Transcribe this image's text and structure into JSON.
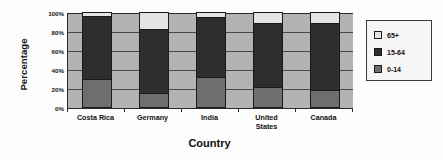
{
  "chart_data": {
    "type": "bar",
    "subtype": "stacked-percentage-column",
    "title": "",
    "xlabel": "Country",
    "ylabel": "Percentage",
    "categories": [
      "Costa Rica",
      "Germany",
      "India",
      "United States",
      "Canada"
    ],
    "category_lines": [
      [
        "Costa Rica"
      ],
      [
        "Germany"
      ],
      [
        "India"
      ],
      [
        "United",
        "States"
      ],
      [
        "Canada"
      ]
    ],
    "series": [
      {
        "name": "0-14",
        "color": "#6e6e6e",
        "values": [
          30,
          15,
          32,
          21,
          18
        ]
      },
      {
        "name": "15-64",
        "color": "#2e2e2e",
        "values": [
          66,
          67,
          63,
          67,
          70
        ]
      },
      {
        "name": "65+",
        "color": "#e4e4e4",
        "values": [
          4,
          18,
          5,
          12,
          12
        ]
      }
    ],
    "ylim": [
      0,
      100
    ],
    "yticks": [
      0,
      20,
      40,
      60,
      80,
      100
    ],
    "ytick_labels": [
      "0%",
      "20%",
      "40%",
      "60%",
      "80%",
      "100%"
    ],
    "grid": true,
    "grid_axis": "y",
    "legend_position": "right",
    "legend_order": [
      "65+",
      "15-64",
      "0-14"
    ],
    "plot_background": "#b3b3b3"
  },
  "legend": {
    "items": [
      {
        "label": "65+",
        "color": "#e4e4e4"
      },
      {
        "label": "15-64",
        "color": "#2e2e2e"
      },
      {
        "label": "0-14",
        "color": "#6e6e6e"
      }
    ]
  }
}
